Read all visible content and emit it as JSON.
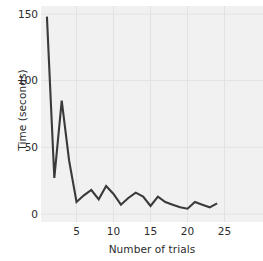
{
  "chart_data": {
    "type": "line",
    "title": "",
    "xlabel": "Number of trials",
    "ylabel": "Time (seconds)",
    "xlim": [
      0.2,
      30.2
    ],
    "ylim": [
      -6,
      156
    ],
    "xticks": [
      5,
      10,
      15,
      20,
      25
    ],
    "yticks": [
      0,
      50,
      100,
      150
    ],
    "grid": true,
    "legend": null,
    "line_color": "#3a3a3a",
    "panel_color": "#f1f1f1",
    "grid_color": "#e2e2e2",
    "x": [
      1,
      2,
      3,
      4,
      5,
      6,
      7,
      8,
      9,
      10,
      11,
      12,
      13,
      14,
      15,
      16,
      17,
      18,
      19,
      20,
      21,
      22,
      23,
      24
    ],
    "values": [
      148,
      27,
      85,
      40,
      9,
      14,
      18,
      11,
      21,
      15,
      7,
      12,
      16,
      13,
      6,
      13,
      9,
      7,
      5,
      4,
      9,
      7,
      5,
      8
    ],
    "series": [
      {
        "name": "Time",
        "values": [
          148,
          27,
          85,
          40,
          9,
          14,
          18,
          11,
          21,
          15,
          7,
          12,
          16,
          13,
          6,
          13,
          9,
          7,
          5,
          4,
          9,
          7,
          5,
          8
        ]
      }
    ]
  },
  "axes": {
    "y_label": "Time (seconds)",
    "x_label": "Number of trials",
    "y_tick_labels": [
      "0",
      "50",
      "100",
      "150"
    ],
    "x_tick_labels": [
      "5",
      "10",
      "15",
      "20",
      "25"
    ]
  }
}
